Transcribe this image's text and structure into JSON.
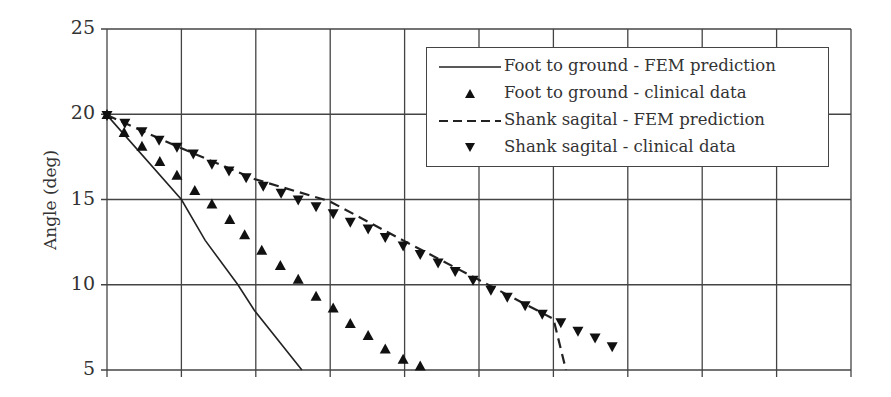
{
  "chart_data": {
    "type": "line",
    "title": "",
    "xlabel": "",
    "ylabel": "Angle (deg)",
    "ylim": [
      5,
      25
    ],
    "yticks": [
      5,
      10,
      15,
      20,
      25
    ],
    "xlim": [
      0,
      10
    ],
    "x_tick_labels_visible": false,
    "x_grid_divisions": 10,
    "grid": true,
    "legend_position": "upper right (inside)",
    "series": [
      {
        "name": "Foot to ground - FEM prediction",
        "style": "solid line",
        "points": [
          [
            0,
            19.95
          ],
          [
            1.0,
            15.0
          ],
          [
            1.32,
            12.6
          ],
          [
            1.76,
            10.0
          ],
          [
            1.98,
            8.5
          ],
          [
            2.62,
            5.0
          ]
        ]
      },
      {
        "name": "Foot to ground - clinical data",
        "style": "up-triangle markers",
        "points": [
          [
            0,
            19.95
          ],
          [
            0.23,
            18.9
          ],
          [
            0.47,
            18.1
          ],
          [
            0.71,
            17.2
          ],
          [
            0.94,
            16.4
          ],
          [
            1.18,
            15.5
          ],
          [
            1.41,
            14.7
          ],
          [
            1.65,
            13.8
          ],
          [
            1.85,
            12.9
          ],
          [
            2.08,
            12.0
          ],
          [
            2.33,
            11.1
          ],
          [
            2.57,
            10.3
          ],
          [
            2.81,
            9.3
          ],
          [
            3.04,
            8.6
          ],
          [
            3.27,
            7.7
          ],
          [
            3.51,
            7.0
          ],
          [
            3.74,
            6.2
          ],
          [
            3.98,
            5.6
          ],
          [
            4.21,
            5.2
          ]
        ]
      },
      {
        "name": "Shank sagital - FEM prediction",
        "style": "dashed line",
        "points": [
          [
            0,
            19.95
          ],
          [
            1.0,
            18.0
          ],
          [
            1.98,
            16.2
          ],
          [
            2.99,
            14.9
          ],
          [
            3.98,
            12.6
          ],
          [
            4.99,
            10.3
          ],
          [
            6.0,
            8.0
          ],
          [
            6.17,
            5.0
          ]
        ]
      },
      {
        "name": "Shank sagital - clinical data",
        "style": "down-triangle markers",
        "points": [
          [
            0,
            19.95
          ],
          [
            0.24,
            19.5
          ],
          [
            0.47,
            19.0
          ],
          [
            0.7,
            18.5
          ],
          [
            0.94,
            18.1
          ],
          [
            1.16,
            17.7
          ],
          [
            1.41,
            17.1
          ],
          [
            1.64,
            16.7
          ],
          [
            1.87,
            16.3
          ],
          [
            2.1,
            15.8
          ],
          [
            2.34,
            15.4
          ],
          [
            2.57,
            15.0
          ],
          [
            2.81,
            14.6
          ],
          [
            3.04,
            14.2
          ],
          [
            3.27,
            13.7
          ],
          [
            3.51,
            13.3
          ],
          [
            3.74,
            12.8
          ],
          [
            3.98,
            12.3
          ],
          [
            4.21,
            11.8
          ],
          [
            4.45,
            11.3
          ],
          [
            4.68,
            10.8
          ],
          [
            4.92,
            10.3
          ],
          [
            5.16,
            9.7
          ],
          [
            5.38,
            9.3
          ],
          [
            5.62,
            8.8
          ],
          [
            5.85,
            8.3
          ],
          [
            6.1,
            7.8
          ],
          [
            6.33,
            7.3
          ],
          [
            6.56,
            6.9
          ],
          [
            6.79,
            6.4
          ]
        ]
      }
    ]
  },
  "axis": {
    "ylabel": "Angle (deg)",
    "yticks": [
      "25",
      "20",
      "15",
      "10",
      "5"
    ]
  },
  "legend": {
    "items": [
      {
        "label": "Foot to ground - FEM prediction",
        "icon": "solid-line"
      },
      {
        "label": "Foot to ground - clinical data",
        "icon": "up-triangle"
      },
      {
        "label": "Shank sagital - FEM prediction",
        "icon": "dashed-line"
      },
      {
        "label": "Shank sagital - clinical data",
        "icon": "down-triangle"
      }
    ]
  },
  "colors": {
    "line": "#222222",
    "grid": "#444444",
    "background": "#ffffff"
  }
}
